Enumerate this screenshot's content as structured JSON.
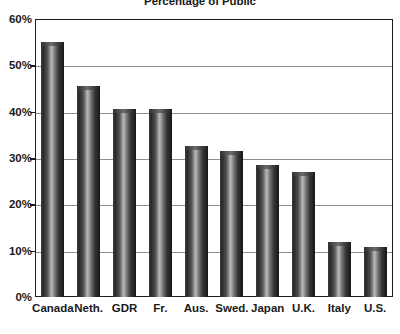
{
  "chart_data": {
    "type": "bar",
    "title": "Percentage of Public",
    "xlabel": "",
    "ylabel": "",
    "ylim": [
      0,
      60
    ],
    "ytick_labels": [
      "0%",
      "10%",
      "20%",
      "30%",
      "40%",
      "50%",
      "60%"
    ],
    "ytick_values": [
      0,
      10,
      20,
      30,
      40,
      50,
      60
    ],
    "grid": true,
    "legend": "none",
    "categories": [
      "Canada",
      "Neth.",
      "GDR",
      "Fr.",
      "Aus.",
      "Swed.",
      "Japan",
      "U.K.",
      "Italy",
      "U.S."
    ],
    "values": [
      55,
      45.5,
      40.5,
      40.5,
      32.5,
      31.5,
      28.5,
      27,
      11.8,
      10.8
    ],
    "bar_color": "#3a3a3a"
  },
  "chart": {
    "title": "Percentage of Public"
  }
}
